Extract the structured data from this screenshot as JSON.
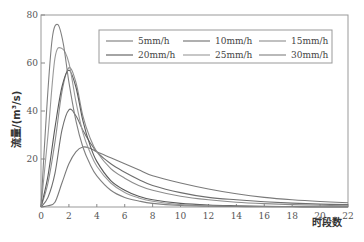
{
  "chart_data": {
    "type": "line",
    "title": "",
    "xlabel": "时段数",
    "ylabel": "流量/(m³/s)",
    "xlim": [
      0,
      22
    ],
    "ylim": [
      0,
      80
    ],
    "x_ticks": [
      0,
      2,
      4,
      6,
      8,
      10,
      12,
      14,
      16,
      18,
      20,
      22
    ],
    "y_ticks": [
      20,
      40,
      60,
      80
    ],
    "grid": false,
    "legend_position": "upper right",
    "series": [
      {
        "name": "5mm/h",
        "color": "#7a7a7a",
        "x": [
          0,
          0.5,
          1,
          1.5,
          2,
          2.5,
          3,
          3.5,
          4,
          5,
          6,
          7,
          8,
          10,
          12,
          14,
          16,
          18,
          20,
          22
        ],
        "y": [
          0,
          0.5,
          2,
          10,
          18,
          23,
          25,
          24.5,
          23,
          20.5,
          18,
          15.5,
          13,
          10,
          7.5,
          5.5,
          4,
          3,
          2.3,
          1.8
        ]
      },
      {
        "name": "10mm/h",
        "color": "#6e6e6e",
        "x": [
          0,
          0.5,
          1,
          1.5,
          2,
          2.5,
          3,
          3.5,
          4,
          5,
          6,
          7,
          8,
          10,
          12,
          14,
          16,
          18,
          20,
          22
        ],
        "y": [
          0,
          4,
          14,
          32,
          40.5,
          38,
          32,
          27,
          23,
          18,
          14.5,
          11.5,
          9,
          6,
          4,
          3,
          2.2,
          1.6,
          1.2,
          1
        ]
      },
      {
        "name": "15mm/h",
        "color": "#8c8c8c",
        "x": [
          0,
          0.5,
          1,
          1.5,
          2,
          2.5,
          3,
          3.5,
          4,
          5,
          6,
          7,
          8,
          10,
          12,
          14,
          16,
          18,
          20,
          22
        ],
        "y": [
          0,
          10,
          27,
          48,
          58,
          52,
          38,
          29,
          23,
          16,
          12,
          9,
          7,
          4.5,
          3,
          2,
          1.4,
          1,
          0.7,
          0.5
        ]
      },
      {
        "name": "20mm/h",
        "color": "#5a5a5a",
        "x": [
          0,
          0.5,
          1,
          1.5,
          2,
          2.5,
          3,
          3.5,
          4,
          5,
          6,
          7,
          8,
          10,
          12,
          14,
          16,
          18,
          20,
          22
        ],
        "y": [
          0,
          13,
          33,
          50,
          57,
          50,
          36,
          26,
          19,
          11,
          7,
          4.5,
          3,
          1.5,
          0.8,
          0.5,
          0.3,
          0.2,
          0.1,
          0.1
        ]
      },
      {
        "name": "25mm/h",
        "color": "#9a9a9a",
        "x": [
          0,
          0.5,
          1,
          1.5,
          2,
          2.5,
          3,
          3.5,
          4,
          5,
          6,
          7,
          8,
          10,
          12,
          14,
          16,
          18,
          20,
          22
        ],
        "y": [
          0,
          30,
          62,
          66,
          60,
          44,
          31,
          23,
          17,
          10,
          6,
          3.8,
          2.4,
          1,
          0.5,
          0.3,
          0.2,
          0.1,
          0.1,
          0
        ]
      },
      {
        "name": "30mm/h",
        "color": "#808080",
        "x": [
          0,
          0.4,
          0.8,
          1.2,
          1.6,
          2,
          2.5,
          3,
          3.5,
          4,
          5,
          6,
          7,
          8,
          10,
          12,
          14,
          16,
          18,
          20,
          22
        ],
        "y": [
          0,
          40,
          70,
          76,
          68,
          52,
          36,
          25,
          18,
          13,
          7,
          4,
          2.5,
          1.5,
          0.6,
          0.3,
          0.2,
          0.1,
          0.1,
          0,
          0
        ]
      }
    ]
  },
  "legend": {
    "items": [
      "5mm/h",
      "10mm/h",
      "15mm/h",
      "20mm/h",
      "25mm/h",
      "30mm/h"
    ]
  },
  "axes": {
    "xlabel": "时段数",
    "ylabel": "流量/(m³/s)"
  }
}
